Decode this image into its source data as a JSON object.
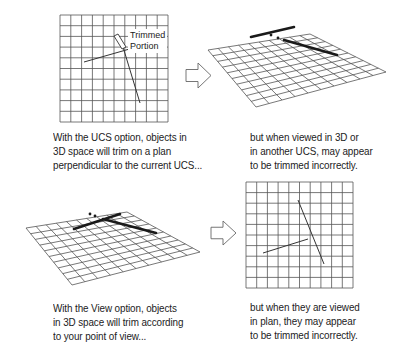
{
  "colors": {
    "background": "#ffffff",
    "grid": "#555555",
    "thin_line": "#333333",
    "thick_line": "#1a1a1a",
    "arrow_stroke": "#666666",
    "text": "#222222"
  },
  "panels": [
    {
      "id": "ucs-plan",
      "grid": {
        "divisions": 10,
        "corners": [
          [
            60,
            15
          ],
          [
            168,
            15
          ],
          [
            168,
            122
          ],
          [
            60,
            122
          ]
        ]
      },
      "thin_lines": [
        [
          [
            84,
            62
          ],
          [
            133,
            48
          ]
        ],
        [
          [
            123,
            47
          ],
          [
            140,
            103
          ]
        ]
      ],
      "thick_lines": [],
      "trimmed_piece": {
        "points": [
          [
            114,
            36
          ],
          [
            118,
            34
          ],
          [
            126,
            47
          ],
          [
            122,
            49
          ]
        ]
      },
      "label": {
        "lines": [
          "Trimmed",
          "Portion"
        ],
        "x": 128,
        "y": 29
      },
      "caption": {
        "x": 53,
        "y": 130,
        "lines": [
          "With the UCS option, objects in",
          "3D space will trim on a plan",
          "perpendicular to the current UCS..."
        ]
      }
    },
    {
      "id": "ucs-3d",
      "grid": {
        "divisions": 10,
        "corners": [
          [
            208,
            50
          ],
          [
            310,
            34
          ],
          [
            386,
            72
          ],
          [
            256,
            107
          ]
        ]
      },
      "thin_lines": [],
      "thick_lines": [
        [
          [
            251,
            37
          ],
          [
            294,
            27
          ]
        ],
        [
          [
            284,
            40
          ],
          [
            337,
            55
          ]
        ]
      ],
      "dots": [
        [
          271,
          35
        ],
        [
          278,
          38
        ]
      ],
      "caption": {
        "x": 250,
        "y": 130,
        "lines": [
          "but when viewed in 3D or",
          "in another UCS, may appear",
          "to be trimmed incorrectly."
        ]
      }
    },
    {
      "id": "view-3d",
      "grid": {
        "divisions": 10,
        "corners": [
          [
            26,
            228
          ],
          [
            127,
            212
          ],
          [
            200,
            252
          ],
          [
            72,
            285
          ]
        ]
      },
      "thin_lines": [],
      "thick_lines": [
        [
          [
            74,
            229
          ],
          [
            120,
            214
          ]
        ],
        [
          [
            103,
            219
          ],
          [
            156,
            233
          ]
        ]
      ],
      "dots": [
        [
          90,
          214
        ],
        [
          95,
          216
        ]
      ],
      "caption": {
        "x": 53,
        "y": 301,
        "lines": [
          "With the View option, objects",
          "in 3D space will trim according",
          "to your point of view..."
        ]
      }
    },
    {
      "id": "view-plan",
      "grid": {
        "divisions": 10,
        "corners": [
          [
            246,
            182
          ],
          [
            353,
            182
          ],
          [
            353,
            288
          ],
          [
            246,
            288
          ]
        ]
      },
      "thin_lines": [
        [
          [
            263,
            253
          ],
          [
            308,
            239
          ]
        ],
        [
          [
            298,
            200
          ],
          [
            324,
            264
          ]
        ]
      ],
      "thick_lines": [],
      "caption": {
        "x": 250,
        "y": 300,
        "lines": [
          "but when they are viewed",
          "in plan, they may appear",
          "to be trimmed incorrectly."
        ]
      }
    }
  ],
  "arrows": [
    {
      "id": "arrow-top",
      "icon": "right-arrow-icon",
      "x": 186,
      "y": 63,
      "w": 25,
      "h": 25
    },
    {
      "id": "arrow-bottom",
      "icon": "right-arrow-icon",
      "x": 211,
      "y": 221,
      "w": 25,
      "h": 24
    }
  ]
}
